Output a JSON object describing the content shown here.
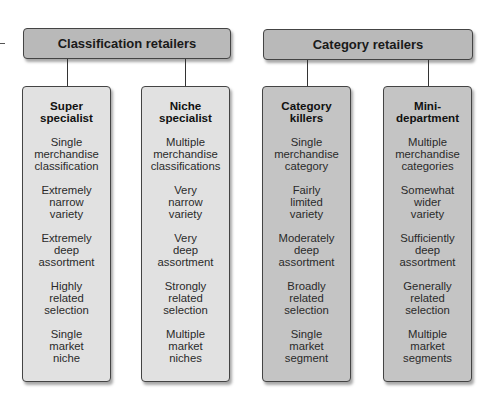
{
  "groups": [
    {
      "title": "Classification retailers",
      "columns": [
        {
          "title": "Super\nspecialist",
          "items": [
            "Single\nmerchandise\nclassification",
            "Extremely\nnarrow\nvariety",
            "Extremely\ndeep\nassortment",
            "Highly\nrelated\nselection",
            "Single\nmarket\nniche"
          ]
        },
        {
          "title": "Niche\nspecialist",
          "items": [
            "Multiple\nmerchandise\nclassifications",
            "Very\nnarrow\nvariety",
            "Very\ndeep\nassortment",
            "Strongly\nrelated\nselection",
            "Multiple\nmarket\nniches"
          ]
        }
      ]
    },
    {
      "title": "Category retailers",
      "columns": [
        {
          "title": "Category\nkillers",
          "items": [
            "Single\nmerchandise\ncategory",
            "Fairly\nlimited\nvariety",
            "Moderately\ndeep\nassortment",
            "Broadly\nrelated\nselection",
            "Single\nmarket\nsegment"
          ]
        },
        {
          "title": "Mini-\ndepartment",
          "items": [
            "Multiple\nmerchandise\ncategories",
            "Somewhat\nwider\nvariety",
            "Sufficiently\ndeep\nassortment",
            "Generally\nrelated\nselection",
            "Multiple\nmarket\nsegments"
          ]
        }
      ]
    }
  ],
  "colors": {
    "header_fill": "#b9b9b9",
    "column_light": "#e1e1e1",
    "column_dark": "#c4c4c4",
    "border": "#444444"
  }
}
